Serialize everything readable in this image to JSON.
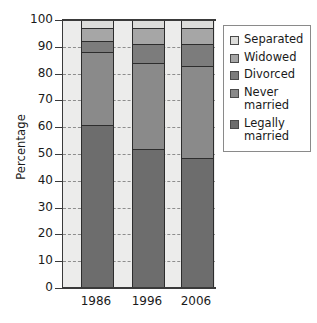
{
  "chart_data": {
    "type": "bar",
    "subtype": "stacked-100-percent",
    "title": "",
    "xlabel": "",
    "ylabel": "Percentage",
    "ylim": [
      0,
      100
    ],
    "ytick_step": 10,
    "ytick_labels": [
      "100",
      "90",
      "80",
      "70",
      "60",
      "50",
      "40",
      "30",
      "20",
      "10",
      "0"
    ],
    "grid": true,
    "grid_style": "horizontal dashed",
    "legend_position": "right",
    "categories": [
      "1986",
      "1996",
      "2006"
    ],
    "series": [
      {
        "name": "Legally married",
        "color": "#6d6d6d",
        "values": [
          61,
          52,
          48.5
        ]
      },
      {
        "name": "Never married",
        "color": "#8a8a8a",
        "values": [
          27,
          32,
          34.5
        ]
      },
      {
        "name": "Divorced",
        "color": "#7c7c7c",
        "values": [
          4,
          7,
          8
        ]
      },
      {
        "name": "Widowed",
        "color": "#a6a6a6",
        "values": [
          5,
          6,
          6
        ]
      },
      {
        "name": "Separated",
        "color": "#dcdcda",
        "values": [
          3,
          3,
          3
        ]
      }
    ],
    "stack_boundaries": {
      "1986": [
        0,
        61,
        88,
        92,
        97,
        100
      ],
      "1996": [
        0,
        52,
        84,
        91,
        97,
        100
      ],
      "2006": [
        0,
        48.5,
        83,
        91,
        97,
        100
      ]
    }
  },
  "legend": {
    "items": [
      {
        "label": "Separated",
        "color": "#dcdcda"
      },
      {
        "label": "Widowed",
        "color": "#a6a6a6"
      },
      {
        "label": "Divorced",
        "color": "#7c7c7c"
      },
      {
        "label": "Never\nmarried",
        "color": "#8a8a8a"
      },
      {
        "label": "Legally\nmarried",
        "color": "#6d6d6d"
      }
    ]
  },
  "axes": {
    "y_title": "Percentage",
    "x_tick_labels": [
      "1986",
      "1996",
      "2006"
    ],
    "y_tick_labels": [
      "100",
      "90",
      "80",
      "70",
      "60",
      "50",
      "40",
      "30",
      "20",
      "10",
      "0"
    ]
  },
  "colors": {
    "plot_background": "#ececeb",
    "axis": "#3a3a3a",
    "gridline": "#8d8d8d",
    "page_background": "#ffffff"
  }
}
